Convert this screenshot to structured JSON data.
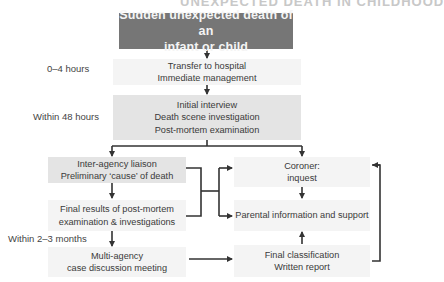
{
  "header": {
    "cut_off_title_fragment": "UNEXPECTED DEATH IN CHILDHOOD"
  },
  "timeline": [
    {
      "label": "0–4 hours"
    },
    {
      "label": "Within 48 hours"
    },
    {
      "label": "Within 2–3 months"
    }
  ],
  "nodes": {
    "start": {
      "line1": "Sudden unexpected death of an",
      "line2": "infant or child"
    },
    "transfer": {
      "line1": "Transfer to hospital",
      "line2": "Immediate management"
    },
    "initial": {
      "line1": "Initial interview",
      "line2": "Death scene investigation",
      "line3": "Post-mortem examination"
    },
    "liaison": {
      "line1": "Inter-agency liaison",
      "line2": "Preliminary ‘cause’ of death"
    },
    "coroner": {
      "line1": "Coroner:",
      "line2": "inquest"
    },
    "final_results": {
      "line1": "Final results of post-mortem",
      "line2": "examination & investigations"
    },
    "parental": {
      "line1": "Parental information and support"
    },
    "multiagency": {
      "line1": "Multi-agency",
      "line2": "case discussion meeting"
    },
    "classification": {
      "line1": "Final classification",
      "line2": "Written report"
    }
  },
  "colors": {
    "start_box": "#767676",
    "box_light": "#efefef",
    "box_mid": "#e4e4e4",
    "connector": "#333333"
  }
}
